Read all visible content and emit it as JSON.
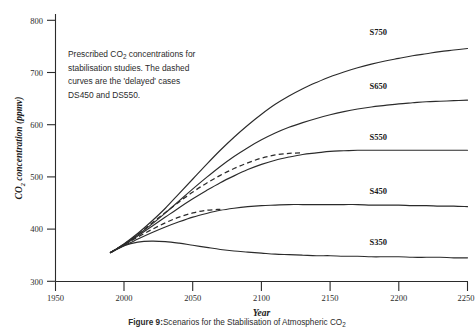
{
  "figure": {
    "caption_lead": "Figure 9:",
    "caption_text": "Scenarios for the Stabilisation of Atmospheric CO",
    "caption_sub": "2",
    "annotation_lines": [
      "Prescribed CO₂ concentrations for",
      "stabilisation studies. The dashed",
      "curves are the 'delayed' cases",
      "DS450 and DS550."
    ],
    "annotation_text": "Prescribed CO2 concentrations for stabilisation studies. The dashed curves are the 'delayed' cases DS450 and DS550."
  },
  "chart_data": {
    "type": "line",
    "title": "",
    "xlabel": "Year",
    "ylabel": "CO2 concentration (ppmv)",
    "ylabel_display": "CO",
    "ylabel_sub": "2",
    "ylabel_rest": " concentration (ppmv)",
    "xlim": [
      1950,
      2250
    ],
    "ylim": [
      300,
      800
    ],
    "xticks": [
      1950,
      2000,
      2050,
      2100,
      2150,
      2200,
      2250
    ],
    "xtick_labels": [
      "1950",
      "2000",
      "2050",
      "2100",
      "2150",
      "2200",
      "2250"
    ],
    "yticks": [
      300,
      400,
      500,
      600,
      700,
      800
    ],
    "ytick_labels": [
      "300",
      "400",
      "500",
      "600",
      "700",
      "800"
    ],
    "grid": false,
    "legend": "inline-curve-labels",
    "series": [
      {
        "name": "S750",
        "label": "S750",
        "style": "solid",
        "label_year": 2185,
        "label_value": 772,
        "x": [
          1990,
          2000,
          2010,
          2020,
          2030,
          2040,
          2050,
          2060,
          2070,
          2080,
          2090,
          2100,
          2110,
          2120,
          2130,
          2140,
          2150,
          2160,
          2170,
          2180,
          2190,
          2200,
          2210,
          2220,
          2230,
          2240,
          2250
        ],
        "y": [
          355,
          372,
          392,
          415,
          440,
          468,
          496,
          524,
          551,
          576,
          599,
          620,
          639,
          655,
          669,
          681,
          692,
          701,
          709,
          716,
          722,
          727,
          732,
          736,
          740,
          743,
          746
        ]
      },
      {
        "name": "S650",
        "label": "S650",
        "style": "solid",
        "label_year": 2185,
        "label_value": 668,
        "x": [
          1990,
          2000,
          2010,
          2020,
          2030,
          2040,
          2050,
          2060,
          2070,
          2080,
          2090,
          2100,
          2110,
          2120,
          2130,
          2140,
          2150,
          2160,
          2170,
          2180,
          2190,
          2200,
          2210,
          2220,
          2230,
          2240,
          2250
        ],
        "y": [
          355,
          371,
          389,
          409,
          431,
          454,
          477,
          499,
          520,
          539,
          556,
          571,
          584,
          595,
          604,
          612,
          619,
          625,
          630,
          634,
          637,
          640,
          642,
          644,
          645,
          646,
          647
        ]
      },
      {
        "name": "S550",
        "label": "S550",
        "style": "solid",
        "label_year": 2185,
        "label_value": 570,
        "x": [
          1990,
          2000,
          2010,
          2020,
          2030,
          2040,
          2050,
          2060,
          2070,
          2080,
          2090,
          2100,
          2110,
          2120,
          2130,
          2140,
          2150,
          2160,
          2170,
          2180,
          2190,
          2200,
          2210,
          2220,
          2230,
          2240,
          2250
        ],
        "y": [
          355,
          370,
          387,
          405,
          423,
          441,
          458,
          474,
          489,
          502,
          514,
          524,
          532,
          538,
          543,
          546,
          549,
          550,
          551,
          551,
          551,
          551,
          551,
          551,
          551,
          551,
          551
        ]
      },
      {
        "name": "S450",
        "label": "S450",
        "style": "solid",
        "label_year": 2185,
        "label_value": 468,
        "x": [
          1990,
          2000,
          2010,
          2020,
          2030,
          2040,
          2050,
          2060,
          2070,
          2080,
          2090,
          2100,
          2110,
          2120,
          2130,
          2140,
          2150,
          2160,
          2170,
          2180,
          2190,
          2200,
          2210,
          2220,
          2230,
          2240,
          2250
        ],
        "y": [
          355,
          368,
          381,
          393,
          404,
          414,
          423,
          430,
          436,
          440,
          443,
          445,
          446,
          447,
          447,
          447,
          447,
          447,
          447,
          446,
          446,
          446,
          445,
          445,
          444,
          444,
          443
        ]
      },
      {
        "name": "S350",
        "label": "S350",
        "style": "solid",
        "label_year": 2185,
        "label_value": 369,
        "x": [
          1990,
          2000,
          2010,
          2020,
          2030,
          2040,
          2050,
          2060,
          2070,
          2080,
          2090,
          2100,
          2110,
          2120,
          2130,
          2140,
          2150,
          2160,
          2170,
          2180,
          2190,
          2200,
          2210,
          2220,
          2230,
          2240,
          2250
        ],
        "y": [
          355,
          368,
          375,
          377,
          376,
          373,
          369,
          365,
          361,
          358,
          356,
          354,
          352,
          351,
          350,
          349,
          349,
          348,
          348,
          347,
          347,
          347,
          346,
          346,
          346,
          345,
          345
        ]
      },
      {
        "name": "DS550",
        "label": "",
        "style": "dashed",
        "note": "delayed case, merges with S550 near 2130",
        "x": [
          1990,
          2000,
          2010,
          2020,
          2030,
          2040,
          2050,
          2060,
          2070,
          2080,
          2090,
          2100,
          2110,
          2120,
          2130
        ],
        "y": [
          355,
          371,
          390,
          411,
          432,
          452,
          471,
          488,
          503,
          516,
          527,
          536,
          542,
          545,
          546
        ]
      },
      {
        "name": "DS450",
        "label": "",
        "style": "dashed",
        "note": "delayed case, merges with S450 near 2070",
        "x": [
          1990,
          2000,
          2010,
          2020,
          2030,
          2040,
          2050,
          2060,
          2070
        ],
        "y": [
          355,
          370,
          385,
          399,
          412,
          423,
          431,
          436,
          438
        ]
      }
    ]
  }
}
